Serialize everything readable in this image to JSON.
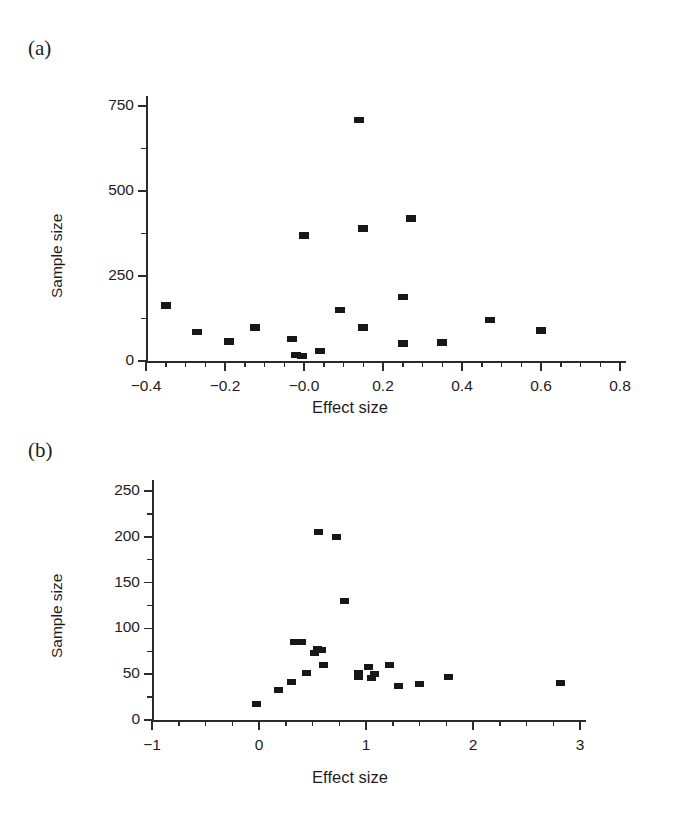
{
  "figure": {
    "background": "#ffffff",
    "marker_color": "#171717",
    "axis_color": "#2b2b2b",
    "text_color": "#1d1d1d"
  },
  "panels": [
    {
      "tag": "(a)",
      "xlabel": "Effect size",
      "ylabel": "Sample size"
    },
    {
      "tag": "(b)",
      "xlabel": "Effect size",
      "ylabel": "Sample size"
    }
  ],
  "chart_data": [
    {
      "type": "scatter",
      "panel": "(a)",
      "title": "",
      "xlabel": "Effect size",
      "ylabel": "Sample size",
      "xlim": [
        -0.4,
        0.8
      ],
      "ylim": [
        0,
        780
      ],
      "xticks": [
        -0.4,
        -0.2,
        -0.0,
        0.2,
        0.4,
        0.6,
        0.8
      ],
      "xtick_labels": [
        "−0.4",
        "−0.2",
        "−0.0",
        "0.2",
        "0.4",
        "0.6",
        "0.8"
      ],
      "xminor_step": 0.05,
      "yticks": [
        0,
        250,
        500,
        750
      ],
      "ytick_labels": [
        "0",
        "250",
        "500",
        "750"
      ],
      "yminor_ticks": [
        125,
        375,
        625
      ],
      "grid": false,
      "legend": null,
      "points": [
        {
          "x": -0.35,
          "y": 163
        },
        {
          "x": -0.27,
          "y": 85
        },
        {
          "x": -0.19,
          "y": 57
        },
        {
          "x": -0.125,
          "y": 98
        },
        {
          "x": -0.03,
          "y": 65
        },
        {
          "x": -0.02,
          "y": 18
        },
        {
          "x": -0.005,
          "y": 14
        },
        {
          "x": 0.0,
          "y": 370
        },
        {
          "x": 0.04,
          "y": 30
        },
        {
          "x": 0.09,
          "y": 150
        },
        {
          "x": 0.14,
          "y": 710
        },
        {
          "x": 0.15,
          "y": 390
        },
        {
          "x": 0.15,
          "y": 98
        },
        {
          "x": 0.25,
          "y": 188
        },
        {
          "x": 0.25,
          "y": 52
        },
        {
          "x": 0.27,
          "y": 420
        },
        {
          "x": 0.35,
          "y": 55
        },
        {
          "x": 0.47,
          "y": 120
        },
        {
          "x": 0.6,
          "y": 90
        }
      ]
    },
    {
      "type": "scatter",
      "panel": "(b)",
      "title": "",
      "xlabel": "Effect size",
      "ylabel": "Sample size",
      "xlim": [
        -1,
        3
      ],
      "ylim": [
        0,
        262
      ],
      "xticks": [
        -1,
        0,
        1,
        2,
        3
      ],
      "xtick_labels": [
        "−1",
        "0",
        "1",
        "2",
        "3"
      ],
      "xminor_step": 0.25,
      "yticks": [
        0,
        50,
        100,
        150,
        200,
        250
      ],
      "ytick_labels": [
        "0",
        "50",
        "100",
        "150",
        "200",
        "250"
      ],
      "yminor_ticks": [
        25,
        75,
        125,
        175,
        225
      ],
      "grid": false,
      "legend": null,
      "points": [
        {
          "x": -0.02,
          "y": 17
        },
        {
          "x": 0.18,
          "y": 33
        },
        {
          "x": 0.3,
          "y": 42
        },
        {
          "x": 0.33,
          "y": 85
        },
        {
          "x": 0.4,
          "y": 85
        },
        {
          "x": 0.44,
          "y": 51
        },
        {
          "x": 0.52,
          "y": 73
        },
        {
          "x": 0.55,
          "y": 77
        },
        {
          "x": 0.56,
          "y": 205
        },
        {
          "x": 0.58,
          "y": 76
        },
        {
          "x": 0.6,
          "y": 60
        },
        {
          "x": 0.72,
          "y": 200
        },
        {
          "x": 0.8,
          "y": 130
        },
        {
          "x": 0.93,
          "y": 51
        },
        {
          "x": 0.93,
          "y": 47
        },
        {
          "x": 1.02,
          "y": 58
        },
        {
          "x": 1.05,
          "y": 46
        },
        {
          "x": 1.08,
          "y": 50
        },
        {
          "x": 1.22,
          "y": 60
        },
        {
          "x": 1.3,
          "y": 37
        },
        {
          "x": 1.5,
          "y": 39
        },
        {
          "x": 1.77,
          "y": 47
        },
        {
          "x": 2.82,
          "y": 40
        }
      ]
    }
  ]
}
